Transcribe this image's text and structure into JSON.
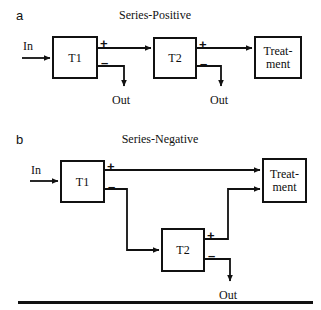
{
  "figure": {
    "panels": [
      {
        "letter": "a",
        "title": "Series-Positive",
        "nodes": [
          {
            "name": "t1",
            "label": "T1"
          },
          {
            "name": "t2",
            "label": "T2"
          },
          {
            "name": "treatment",
            "label": "Treat-\nment",
            "line1": "Treat-",
            "line2": "ment"
          }
        ],
        "labels": {
          "input": "In",
          "output_1": "Out",
          "output_2": "Out",
          "plus_1": "+",
          "minus_1": "–",
          "plus_2": "+",
          "minus_2": "–"
        }
      },
      {
        "letter": "b",
        "title": "Series-Negative",
        "nodes": [
          {
            "name": "t1",
            "label": "T1"
          },
          {
            "name": "t2",
            "label": "T2"
          },
          {
            "name": "treatment",
            "label": "Treat-\nment",
            "line1": "Treat-",
            "line2": "ment"
          }
        ],
        "labels": {
          "input": "In",
          "output_1": "Out",
          "plus_1": "+",
          "minus_1": "–",
          "plus_2": "+",
          "minus_2": "–"
        }
      }
    ],
    "colors": {
      "ink": "#111111",
      "background": "#ffffff"
    }
  }
}
